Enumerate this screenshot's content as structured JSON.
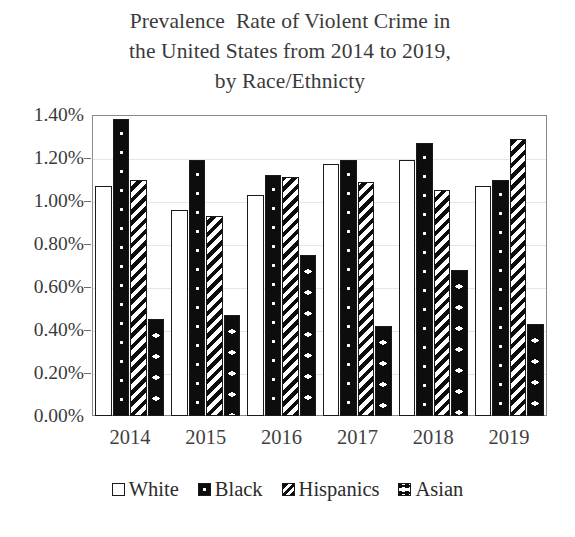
{
  "chart_data": {
    "type": "bar",
    "title": "Prevalence  Rate of Violent Crime in the United States from 2014 to 2019, by Race/Ethnicty",
    "title_lines": [
      "Prevalence  Rate of Violent Crime in",
      "the United States from 2014 to 2019,",
      "by Race/Ethnicty"
    ],
    "xlabel": "",
    "ylabel": "",
    "categories": [
      "2014",
      "2015",
      "2016",
      "2017",
      "2018",
      "2019"
    ],
    "series": [
      {
        "name": "White",
        "values": [
          1.07,
          0.96,
          1.03,
          1.17,
          1.19,
          1.07
        ]
      },
      {
        "name": "Black",
        "values": [
          1.38,
          1.19,
          1.12,
          1.19,
          1.27,
          1.1
        ]
      },
      {
        "name": "Hispanics",
        "values": [
          1.1,
          0.93,
          1.11,
          1.09,
          1.05,
          1.29
        ]
      },
      {
        "name": "Asian",
        "values": [
          0.45,
          0.47,
          0.75,
          0.42,
          0.68,
          0.43
        ]
      }
    ],
    "ylim": [
      0.0,
      1.4
    ],
    "ytick_values": [
      0.0,
      0.2,
      0.4,
      0.6,
      0.8,
      1.0,
      1.2,
      1.4
    ],
    "ytick_labels": [
      "0.00%",
      "0.20%",
      "0.40%",
      "0.60%",
      "0.80%",
      "1.00%",
      "1.20%",
      "1.40%"
    ],
    "grid": true,
    "legend_position": "bottom",
    "value_unit": "%",
    "colors": {
      "plot_background": "#ffffff",
      "frame": "#8a8a8a",
      "gridline": "#e6e6e6",
      "text": "#2b2b2b",
      "bar_outline": "#1a1a1a",
      "fill_dark": "#0d0d0d",
      "fill_light": "#ffffff"
    },
    "series_patterns": [
      "solid-white",
      "black-with-dots",
      "diagonal-stripes",
      "black-with-bowties"
    ]
  },
  "legend": {
    "items": [
      {
        "label": "White",
        "pattern": "solid-white"
      },
      {
        "label": "Black",
        "pattern": "black-with-dots"
      },
      {
        "label": "Hispanics",
        "pattern": "diagonal-stripes"
      },
      {
        "label": "Asian",
        "pattern": "black-with-bowties"
      }
    ]
  }
}
